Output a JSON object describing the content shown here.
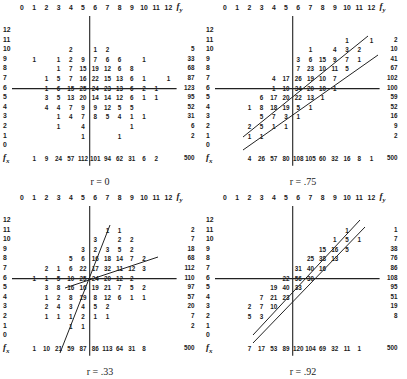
{
  "figure": {
    "columns": [
      "0",
      "1",
      "2",
      "3",
      "4",
      "5",
      "6",
      "7",
      "8",
      "9",
      "10",
      "11",
      "12"
    ],
    "rows": [
      "12",
      "11",
      "10",
      "9",
      "8",
      "7",
      "6",
      "5",
      "4",
      "3",
      "2",
      "1",
      "0"
    ],
    "fy_label": "f",
    "fy_sub": "y",
    "fx_label": "f",
    "fx_sub": "x"
  },
  "chart_data": [
    {
      "type": "table",
      "title": "r = 0",
      "caption": "r=0",
      "cells": [
        [],
        [],
        [
          {
            "c": 4,
            "v": "2"
          },
          {
            "c": 6,
            "v": "1"
          },
          {
            "c": 7,
            "v": "2"
          }
        ],
        [
          {
            "c": 1,
            "v": "1"
          },
          {
            "c": 3,
            "v": "1"
          },
          {
            "c": 4,
            "v": "2"
          },
          {
            "c": 5,
            "v": "9"
          },
          {
            "c": 6,
            "v": "7"
          },
          {
            "c": 7,
            "v": "6"
          },
          {
            "c": 8,
            "v": "6"
          },
          {
            "c": 10,
            "v": "1"
          }
        ],
        [
          {
            "c": 3,
            "v": "1"
          },
          {
            "c": 4,
            "v": "7"
          },
          {
            "c": 5,
            "v": "15"
          },
          {
            "c": 6,
            "v": "19"
          },
          {
            "c": 7,
            "v": "12"
          },
          {
            "c": 8,
            "v": "6"
          },
          {
            "c": 9,
            "v": "8"
          }
        ],
        [
          {
            "c": 2,
            "v": "1"
          },
          {
            "c": 3,
            "v": "5"
          },
          {
            "c": 4,
            "v": "7"
          },
          {
            "c": 5,
            "v": "16"
          },
          {
            "c": 6,
            "v": "22"
          },
          {
            "c": 7,
            "v": "15"
          },
          {
            "c": 8,
            "v": "13"
          },
          {
            "c": 9,
            "v": "6"
          },
          {
            "c": 10,
            "v": "1"
          },
          {
            "c": 12,
            "v": "1"
          }
        ],
        [
          {
            "c": 2,
            "v": "1"
          },
          {
            "c": 3,
            "v": "6"
          },
          {
            "c": 4,
            "v": "15"
          },
          {
            "c": 5,
            "v": "25"
          },
          {
            "c": 6,
            "v": "24"
          },
          {
            "c": 7,
            "v": "23"
          },
          {
            "c": 8,
            "v": "13"
          },
          {
            "c": 9,
            "v": "6"
          },
          {
            "c": 10,
            "v": "2"
          },
          {
            "c": 11,
            "v": "1"
          }
        ],
        [
          {
            "c": 2,
            "v": "3"
          },
          {
            "c": 3,
            "v": "5"
          },
          {
            "c": 4,
            "v": "13"
          },
          {
            "c": 5,
            "v": "20"
          },
          {
            "c": 6,
            "v": "14"
          },
          {
            "c": 7,
            "v": "14"
          },
          {
            "c": 8,
            "v": "12"
          },
          {
            "c": 9,
            "v": "6"
          },
          {
            "c": 10,
            "v": "1"
          },
          {
            "c": 11,
            "v": "1"
          }
        ],
        [
          {
            "c": 2,
            "v": "4"
          },
          {
            "c": 3,
            "v": "4"
          },
          {
            "c": 4,
            "v": "7"
          },
          {
            "c": 5,
            "v": "9"
          },
          {
            "c": 6,
            "v": "9"
          },
          {
            "c": 7,
            "v": "12"
          },
          {
            "c": 8,
            "v": "5"
          },
          {
            "c": 9,
            "v": "5"
          }
        ],
        [
          {
            "c": 3,
            "v": "1"
          },
          {
            "c": 4,
            "v": "4"
          },
          {
            "c": 5,
            "v": "7"
          },
          {
            "c": 6,
            "v": "8"
          },
          {
            "c": 7,
            "v": "5"
          },
          {
            "c": 8,
            "v": "4"
          },
          {
            "c": 9,
            "v": "1"
          },
          {
            "c": 10,
            "v": "1"
          }
        ],
        [
          {
            "c": 3,
            "v": "1"
          },
          {
            "c": 5,
            "v": "4"
          },
          {
            "c": 9,
            "v": "1"
          }
        ],
        [
          {
            "c": 5,
            "v": "1"
          },
          {
            "c": 8,
            "v": "1"
          }
        ],
        []
      ],
      "fy": [
        "",
        "",
        "5",
        "33",
        "68",
        "87",
        "123",
        "95",
        "52",
        "31",
        "6",
        "2",
        ""
      ],
      "fx": [
        "1",
        "9",
        "24",
        "57",
        "112",
        "101",
        "94",
        "62",
        "31",
        "6",
        "2"
      ],
      "fx_cols": [
        1,
        2,
        3,
        4,
        5,
        6,
        7,
        8,
        9,
        10,
        11
      ],
      "total": "500",
      "lines": []
    },
    {
      "type": "table",
      "title": "r = .75",
      "caption": "r=.75",
      "cells": [
        [],
        [
          {
            "c": 10,
            "v": "1"
          },
          {
            "c": 12,
            "v": "1"
          }
        ],
        [
          {
            "c": 7,
            "v": "1"
          },
          {
            "c": 9,
            "v": "4"
          },
          {
            "c": 10,
            "v": "3"
          },
          {
            "c": 11,
            "v": "2"
          }
        ],
        [
          {
            "c": 6,
            "v": "3"
          },
          {
            "c": 7,
            "v": "6"
          },
          {
            "c": 8,
            "v": "15"
          },
          {
            "c": 9,
            "v": "9"
          },
          {
            "c": 10,
            "v": "7"
          },
          {
            "c": 11,
            "v": "1"
          }
        ],
        [
          {
            "c": 6,
            "v": "7"
          },
          {
            "c": 7,
            "v": "23"
          },
          {
            "c": 8,
            "v": "10"
          },
          {
            "c": 9,
            "v": "11"
          },
          {
            "c": 10,
            "v": "5"
          }
        ],
        [
          {
            "c": 4,
            "v": "4"
          },
          {
            "c": 5,
            "v": "17"
          },
          {
            "c": 6,
            "v": "26"
          },
          {
            "c": 7,
            "v": "19"
          },
          {
            "c": 8,
            "v": "10"
          },
          {
            "c": 9,
            "v": "7"
          }
        ],
        [
          {
            "c": 4,
            "v": "1"
          },
          {
            "c": 5,
            "v": "10"
          },
          {
            "c": 6,
            "v": "34"
          },
          {
            "c": 7,
            "v": "20"
          },
          {
            "c": 8,
            "v": "10"
          },
          {
            "c": 9,
            "v": "1"
          }
        ],
        [
          {
            "c": 3,
            "v": "6"
          },
          {
            "c": 4,
            "v": "17"
          },
          {
            "c": 5,
            "v": "20"
          },
          {
            "c": 6,
            "v": "22"
          },
          {
            "c": 7,
            "v": "13"
          },
          {
            "c": 8,
            "v": "1"
          }
        ],
        [
          {
            "c": 2,
            "v": "1"
          },
          {
            "c": 3,
            "v": "8"
          },
          {
            "c": 4,
            "v": "18"
          },
          {
            "c": 5,
            "v": "19"
          },
          {
            "c": 6,
            "v": "5"
          },
          {
            "c": 7,
            "v": "1"
          }
        ],
        [
          {
            "c": 3,
            "v": "5"
          },
          {
            "c": 4,
            "v": "7"
          },
          {
            "c": 5,
            "v": "3"
          },
          {
            "c": 6,
            "v": "1"
          }
        ],
        [
          {
            "c": 2,
            "v": "2"
          },
          {
            "c": 3,
            "v": "5"
          },
          {
            "c": 4,
            "v": "1"
          },
          {
            "c": 5,
            "v": "1"
          }
        ],
        [
          {
            "c": 2,
            "v": "1"
          },
          {
            "c": 3,
            "v": "1"
          }
        ],
        []
      ],
      "fy": [
        "",
        "2",
        "10",
        "41",
        "67",
        "102",
        "100",
        "59",
        "52",
        "16",
        "9",
        "2",
        ""
      ],
      "fx": [
        "4",
        "26",
        "57",
        "80",
        "108",
        "105",
        "60",
        "32",
        "16",
        "8",
        "1"
      ],
      "fx_cols": [
        2,
        3,
        4,
        5,
        6,
        7,
        8,
        9,
        10,
        11,
        12
      ],
      "total": "500",
      "lines": [
        [
          40,
          137,
          165,
          36
        ],
        [
          40,
          150,
          175,
          55
        ]
      ]
    },
    {
      "type": "table",
      "title": "r = .33",
      "caption": "r=.33",
      "cells": [
        [],
        [
          {
            "c": 7,
            "v": "1"
          },
          {
            "c": 8,
            "v": "1"
          }
        ],
        [
          {
            "c": 6,
            "v": "3"
          },
          {
            "c": 8,
            "v": "2"
          },
          {
            "c": 9,
            "v": "2"
          }
        ],
        [
          {
            "c": 5,
            "v": "3"
          },
          {
            "c": 6,
            "v": "2"
          },
          {
            "c": 7,
            "v": "3"
          },
          {
            "c": 8,
            "v": "5"
          },
          {
            "c": 9,
            "v": "2"
          }
        ],
        [
          {
            "c": 4,
            "v": "5"
          },
          {
            "c": 5,
            "v": "6"
          },
          {
            "c": 6,
            "v": "16"
          },
          {
            "c": 7,
            "v": "18"
          },
          {
            "c": 8,
            "v": "14"
          },
          {
            "c": 9,
            "v": "7"
          },
          {
            "c": 10,
            "v": "2"
          }
        ],
        [
          {
            "c": 2,
            "v": "2"
          },
          {
            "c": 3,
            "v": "1"
          },
          {
            "c": 4,
            "v": "6"
          },
          {
            "c": 5,
            "v": "22"
          },
          {
            "c": 6,
            "v": "17"
          },
          {
            "c": 7,
            "v": "32"
          },
          {
            "c": 8,
            "v": "11"
          },
          {
            "c": 9,
            "v": "12"
          },
          {
            "c": 10,
            "v": "3"
          }
        ],
        [
          {
            "c": 1,
            "v": "1"
          },
          {
            "c": 2,
            "v": "1"
          },
          {
            "c": 3,
            "v": "5"
          },
          {
            "c": 4,
            "v": "10"
          },
          {
            "c": 5,
            "v": "25"
          },
          {
            "c": 6,
            "v": "24"
          },
          {
            "c": 7,
            "v": "20"
          },
          {
            "c": 8,
            "v": "12"
          },
          {
            "c": 9,
            "v": "2"
          }
        ],
        [
          {
            "c": 2,
            "v": "3"
          },
          {
            "c": 3,
            "v": "8"
          },
          {
            "c": 4,
            "v": "16"
          },
          {
            "c": 5,
            "v": "16"
          },
          {
            "c": 6,
            "v": "19"
          },
          {
            "c": 7,
            "v": "21"
          },
          {
            "c": 8,
            "v": "7"
          },
          {
            "c": 9,
            "v": "5"
          },
          {
            "c": 10,
            "v": "2"
          }
        ],
        [
          {
            "c": 2,
            "v": "1"
          },
          {
            "c": 3,
            "v": "2"
          },
          {
            "c": 4,
            "v": "8"
          },
          {
            "c": 5,
            "v": "19"
          },
          {
            "c": 6,
            "v": "8"
          },
          {
            "c": 7,
            "v": "12"
          },
          {
            "c": 8,
            "v": "6"
          },
          {
            "c": 9,
            "v": "1"
          },
          {
            "c": 10,
            "v": "1"
          }
        ],
        [
          {
            "c": 2,
            "v": "2"
          },
          {
            "c": 3,
            "v": "4"
          },
          {
            "c": 4,
            "v": "3"
          },
          {
            "c": 5,
            "v": "4"
          },
          {
            "c": 6,
            "v": "5"
          },
          {
            "c": 7,
            "v": "2"
          }
        ],
        [
          {
            "c": 2,
            "v": "1"
          },
          {
            "c": 3,
            "v": "1"
          },
          {
            "c": 4,
            "v": "1"
          },
          {
            "c": 5,
            "v": "2"
          },
          {
            "c": 6,
            "v": "1"
          },
          {
            "c": 7,
            "v": "1"
          }
        ],
        [
          {
            "c": 4,
            "v": "1"
          },
          {
            "c": 5,
            "v": "1"
          }
        ],
        []
      ],
      "fy": [
        "",
        "2",
        "7",
        "18",
        "68",
        "112",
        "110",
        "97",
        "57",
        "20",
        "7",
        "2",
        ""
      ],
      "fx": [
        "1",
        "10",
        "21",
        "59",
        "87",
        "86",
        "113",
        "64",
        "31",
        "8"
      ],
      "fx_cols": [
        1,
        2,
        3,
        4,
        5,
        6,
        7,
        8,
        9,
        10
      ],
      "total": "500",
      "lines": [
        [
          65,
          98,
          158,
          67
        ],
        [
          60,
          163,
          110,
          35
        ]
      ]
    },
    {
      "type": "table",
      "title": "r = .92",
      "caption": "r=.92",
      "cells": [
        [],
        [
          {
            "c": 10,
            "v": "1"
          }
        ],
        [
          {
            "c": 9,
            "v": "1"
          },
          {
            "c": 10,
            "v": "5"
          },
          {
            "c": 11,
            "v": "1"
          }
        ],
        [
          {
            "c": 8,
            "v": "15"
          },
          {
            "c": 9,
            "v": "16"
          },
          {
            "c": 10,
            "v": "5"
          }
        ],
        [
          {
            "c": 7,
            "v": "25"
          },
          {
            "c": 8,
            "v": "38"
          },
          {
            "c": 9,
            "v": "13"
          }
        ],
        [
          {
            "c": 6,
            "v": "31"
          },
          {
            "c": 7,
            "v": "40"
          },
          {
            "c": 8,
            "v": "16"
          }
        ],
        [
          {
            "c": 5,
            "v": "22"
          },
          {
            "c": 6,
            "v": "56"
          },
          {
            "c": 7,
            "v": "30"
          }
        ],
        [
          {
            "c": 4,
            "v": "19"
          },
          {
            "c": 5,
            "v": "40"
          },
          {
            "c": 6,
            "v": "33"
          }
        ],
        [
          {
            "c": 3,
            "v": "7"
          },
          {
            "c": 4,
            "v": "21"
          },
          {
            "c": 5,
            "v": "23"
          }
        ],
        [
          {
            "c": 2,
            "v": "2"
          },
          {
            "c": 3,
            "v": "7"
          },
          {
            "c": 4,
            "v": "10"
          }
        ],
        [
          {
            "c": 2,
            "v": "5"
          },
          {
            "c": 3,
            "v": "3"
          }
        ],
        [],
        []
      ],
      "fy": [
        "",
        "1",
        "7",
        "38",
        "76",
        "86",
        "108",
        "95",
        "51",
        "19",
        "8",
        "",
        ""
      ],
      "fx": [
        "7",
        "17",
        "53",
        "89",
        "120",
        "104",
        "69",
        "32",
        "11",
        "1"
      ],
      "fx_cols": [
        2,
        3,
        4,
        5,
        6,
        7,
        8,
        9,
        10,
        11
      ],
      "total": "500",
      "lines": [
        [
          50,
          145,
          157,
          30
        ],
        [
          50,
          153,
          162,
          37
        ]
      ]
    }
  ]
}
